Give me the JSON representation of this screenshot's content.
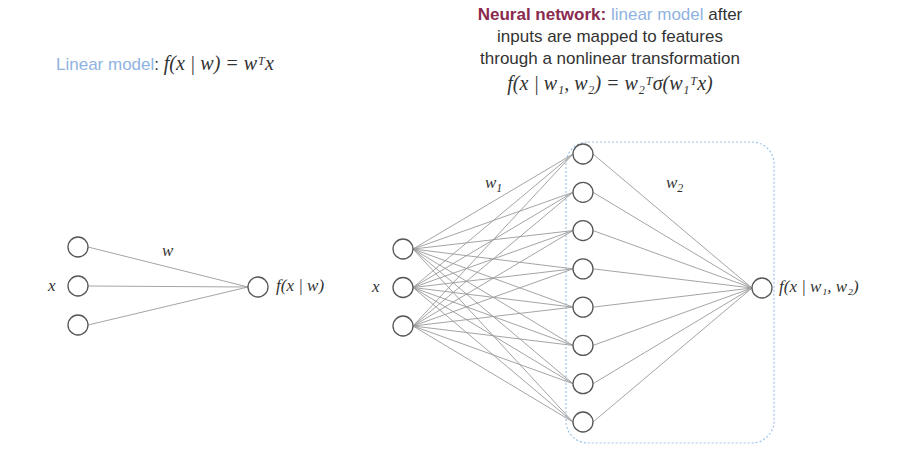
{
  "linear_model": {
    "label": "Linear model",
    "colon": ":",
    "formula": "f(x | w) = wᵀx",
    "input_label": "x",
    "weight_label": "w",
    "output_label": "f(x | w)",
    "input_nodes": 3,
    "output_nodes": 1
  },
  "neural_network": {
    "label": "Neural network:",
    "desc_blue": "linear model",
    "desc_after": "after",
    "desc_line2": "inputs are mapped to features",
    "desc_line3": "through a nonlinear transformation",
    "formula": "f(x | w₁, w₂) = w₂ᵀσ(w₁ᵀx)",
    "input_label": "x",
    "weight1_label": "w",
    "weight1_sub": "1",
    "weight2_label": "w",
    "weight2_sub": "2",
    "output_label": "f(x | w₁, w₂)",
    "input_nodes": 3,
    "hidden_nodes": 8,
    "output_nodes": 1
  },
  "colors": {
    "maroon": "#8a2a4e",
    "light_blue": "#8fb3e0",
    "text": "#333333",
    "node_stroke": "#555555",
    "edge": "#9a9a9a",
    "box": "#9cc3e6"
  }
}
